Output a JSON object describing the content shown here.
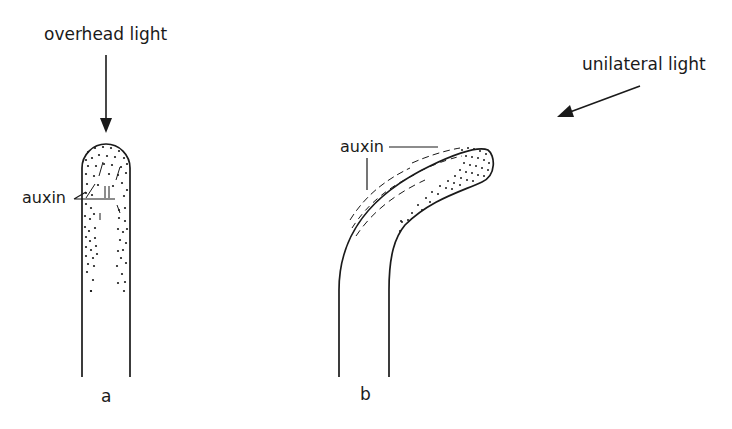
{
  "diagram": {
    "labels": {
      "overhead_light": "overhead light",
      "unilateral_light": "unilateral light",
      "auxin_a": "auxin",
      "auxin_b": "auxin",
      "panel_a": "a",
      "panel_b": "b"
    },
    "colors": {
      "ink": "#1a1a1a",
      "background": "#ffffff"
    }
  }
}
